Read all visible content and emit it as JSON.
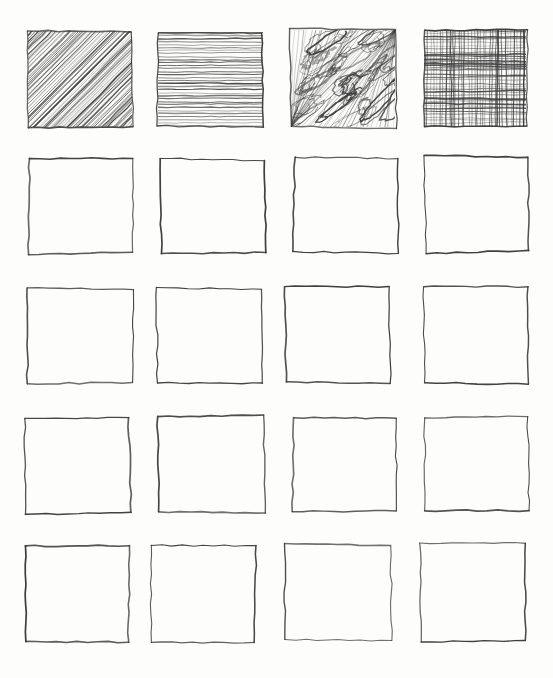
{
  "sheet": {
    "title": "Hand-drawn hatching texture sheet",
    "description": "A grid of hand-drawn pencil squares; the top row is filled with four shading textures, the remaining rows are empty.",
    "background_color": "#fdfdfc",
    "ink_color": "#3b3b3b",
    "columns": 4,
    "rows": 5,
    "total_squares": 20,
    "filled_squares": 4,
    "empty_squares": 16
  },
  "grid": {
    "column_left_edges": [
      27,
      157,
      290,
      423
    ],
    "row_top_edges": [
      30,
      157,
      288,
      417,
      545
    ],
    "cell_width": 105,
    "cell_height": 97
  },
  "squares": [
    {
      "id": "r1c1",
      "row": 1,
      "col": 1,
      "x": 27,
      "y": 30,
      "w": 106,
      "h": 98,
      "fill": "diagonal-hatch",
      "fill_label": "Diagonal hatching",
      "empty": false
    },
    {
      "id": "r1c2",
      "row": 1,
      "col": 2,
      "x": 157,
      "y": 31,
      "w": 107,
      "h": 97,
      "fill": "horizontal-lines",
      "fill_label": "Horizontal lines",
      "empty": false
    },
    {
      "id": "r1c3",
      "row": 1,
      "col": 3,
      "x": 290,
      "y": 29,
      "w": 106,
      "h": 99,
      "fill": "scribble",
      "fill_label": "Looping scribble",
      "empty": false
    },
    {
      "id": "r1c4",
      "row": 1,
      "col": 4,
      "x": 423,
      "y": 29,
      "w": 104,
      "h": 99,
      "fill": "cross-hatch",
      "fill_label": "Cross hatching",
      "empty": false
    },
    {
      "id": "r2c1",
      "row": 2,
      "col": 1,
      "x": 27,
      "y": 157,
      "w": 106,
      "h": 97,
      "fill": "none",
      "fill_label": "Empty",
      "empty": true
    },
    {
      "id": "r2c2",
      "row": 2,
      "col": 2,
      "x": 160,
      "y": 158,
      "w": 106,
      "h": 96,
      "fill": "none",
      "fill_label": "Empty",
      "empty": true
    },
    {
      "id": "r2c3",
      "row": 2,
      "col": 3,
      "x": 293,
      "y": 157,
      "w": 106,
      "h": 96,
      "fill": "none",
      "fill_label": "Empty",
      "empty": true
    },
    {
      "id": "r2c4",
      "row": 2,
      "col": 4,
      "x": 424,
      "y": 156,
      "w": 106,
      "h": 97,
      "fill": "none",
      "fill_label": "Empty",
      "empty": true
    },
    {
      "id": "r3c1",
      "row": 3,
      "col": 1,
      "x": 26,
      "y": 288,
      "w": 107,
      "h": 96,
      "fill": "none",
      "fill_label": "Empty",
      "empty": true
    },
    {
      "id": "r3c2",
      "row": 3,
      "col": 2,
      "x": 155,
      "y": 287,
      "w": 107,
      "h": 97,
      "fill": "none",
      "fill_label": "Empty",
      "empty": true
    },
    {
      "id": "r3c3",
      "row": 3,
      "col": 3,
      "x": 285,
      "y": 287,
      "w": 106,
      "h": 97,
      "fill": "none",
      "fill_label": "Empty",
      "empty": true
    },
    {
      "id": "r3c4",
      "row": 3,
      "col": 4,
      "x": 424,
      "y": 286,
      "w": 105,
      "h": 98,
      "fill": "none",
      "fill_label": "Empty",
      "empty": true
    },
    {
      "id": "r4c1",
      "row": 4,
      "col": 1,
      "x": 23,
      "y": 416,
      "w": 108,
      "h": 98,
      "fill": "none",
      "fill_label": "Empty",
      "empty": true
    },
    {
      "id": "r4c2",
      "row": 4,
      "col": 2,
      "x": 158,
      "y": 415,
      "w": 107,
      "h": 98,
      "fill": "none",
      "fill_label": "Empty",
      "empty": true
    },
    {
      "id": "r4c3",
      "row": 4,
      "col": 3,
      "x": 292,
      "y": 416,
      "w": 106,
      "h": 97,
      "fill": "none",
      "fill_label": "Empty",
      "empty": true
    },
    {
      "id": "r4c4",
      "row": 4,
      "col": 4,
      "x": 423,
      "y": 416,
      "w": 106,
      "h": 97,
      "fill": "none",
      "fill_label": "Empty",
      "empty": true
    },
    {
      "id": "r5c1",
      "row": 5,
      "col": 1,
      "x": 25,
      "y": 545,
      "w": 106,
      "h": 99,
      "fill": "none",
      "fill_label": "Empty",
      "empty": true
    },
    {
      "id": "r5c2",
      "row": 5,
      "col": 2,
      "x": 151,
      "y": 544,
      "w": 106,
      "h": 98,
      "fill": "none",
      "fill_label": "Empty",
      "empty": true
    },
    {
      "id": "r5c3",
      "row": 5,
      "col": 3,
      "x": 285,
      "y": 544,
      "w": 107,
      "h": 98,
      "fill": "none",
      "fill_label": "Empty",
      "empty": true
    },
    {
      "id": "r5c4",
      "row": 5,
      "col": 4,
      "x": 419,
      "y": 543,
      "w": 108,
      "h": 100,
      "fill": "none",
      "fill_label": "Empty",
      "empty": true
    }
  ]
}
